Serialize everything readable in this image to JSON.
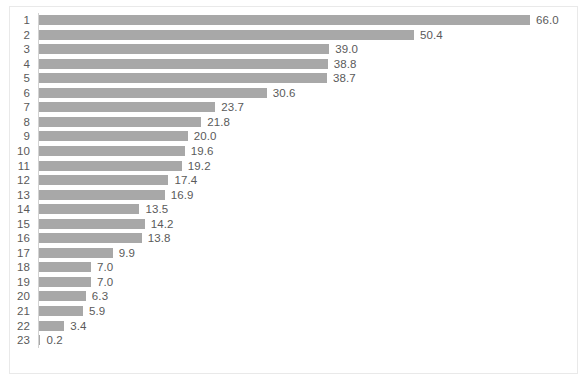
{
  "chart_data": {
    "type": "bar",
    "orientation": "horizontal",
    "title": "",
    "subtitle": "",
    "xlabel": "",
    "ylabel": "",
    "grid": false,
    "legend": null,
    "legend_position": "none",
    "xlim": [
      0,
      66
    ],
    "axis_ticks": [],
    "bar_color": "#a8a8a8",
    "label_color": "#5a5a5a",
    "border_color": "#e9e9e9",
    "background": "#ffffff",
    "value_label_format": "one-decimal",
    "categories": [
      "1",
      "2",
      "3",
      "4",
      "5",
      "6",
      "7",
      "8",
      "9",
      "10",
      "11",
      "12",
      "13",
      "14",
      "15",
      "16",
      "17",
      "18",
      "19",
      "20",
      "21",
      "22",
      "23"
    ],
    "values": [
      66.0,
      50.4,
      39.0,
      38.8,
      38.7,
      30.6,
      23.7,
      21.8,
      20.0,
      19.6,
      19.2,
      17.4,
      16.9,
      13.5,
      14.2,
      13.8,
      9.9,
      7.0,
      7.0,
      6.3,
      5.9,
      3.4,
      0.2
    ],
    "value_labels": [
      "66.0",
      "50.4",
      "39.0",
      "38.8",
      "38.7",
      "30.6",
      "23.7",
      "21.8",
      "20.0",
      "19.6",
      "19.2",
      "17.4",
      "16.9",
      "13.5",
      "14.2",
      "13.8",
      "9.9",
      "7.0",
      "7.0",
      "6.3",
      "5.9",
      "3.4",
      "0.2"
    ]
  },
  "layout": {
    "row_pitch": 14.55,
    "first_row_top": 13,
    "bar_height": 10,
    "axis_x": 38,
    "px_per_unit": 7.44,
    "value_gap": 6
  }
}
